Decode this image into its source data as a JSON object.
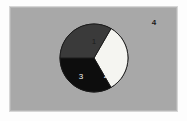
{
  "figure": {
    "background_color": "#ffffff",
    "panel_color": "#a8a8a8",
    "panel_border_color": "#d6d6d6"
  },
  "outside_label": {
    "text": "4",
    "x": 153,
    "y": 22,
    "color": "#1a1a1a"
  },
  "chart_data": {
    "type": "pie",
    "title": "",
    "subtitle": "",
    "xlabel": "",
    "ylabel": "",
    "grid": false,
    "legend_position": "none",
    "center_x": 93,
    "center_y": 57,
    "radius": 34,
    "start_angle_deg": -60,
    "direction": "clockwise",
    "categories": [
      "1",
      "2",
      "3",
      "4"
    ],
    "values": [
      33.3,
      33.3,
      33.3,
      0
    ],
    "labels": [
      "1",
      "2",
      "3",
      "4"
    ],
    "slice_colors": [
      "#f5f5f1",
      "#0d0d0d",
      "#3a3a3a",
      "#a8a8a8"
    ],
    "slice_edge_color": "#1a1a1a",
    "label_positions": [
      {
        "label": "1",
        "x": 93,
        "y": 41,
        "color": "#1d1d1d"
      },
      {
        "label": "2",
        "x": 105,
        "y": 75,
        "color": "#f2f2f2"
      },
      {
        "label": "3",
        "x": 80,
        "y": 76,
        "color": "#f2f2f2"
      }
    ],
    "annotations": [
      {
        "text": "4",
        "x": 153,
        "y": 22,
        "note": "empty slice label drawn outside pie"
      }
    ]
  }
}
